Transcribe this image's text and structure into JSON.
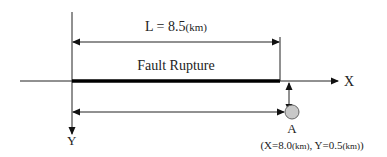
{
  "diagram": {
    "length_label": "L = 8.5",
    "length_unit": "(km)",
    "fault_label": "Fault Rupture",
    "x_axis_label": "X",
    "y_axis_label": "Y",
    "point_label": "A",
    "point_coords": {
      "open": "(X=8.0",
      "x_unit": "(km)",
      "sep": ", Y=0.5",
      "y_unit": "(km)",
      "close": ")"
    },
    "colors": {
      "line": "#111111",
      "point_fill": "#c8c8c8",
      "point_stroke": "#555555"
    }
  }
}
